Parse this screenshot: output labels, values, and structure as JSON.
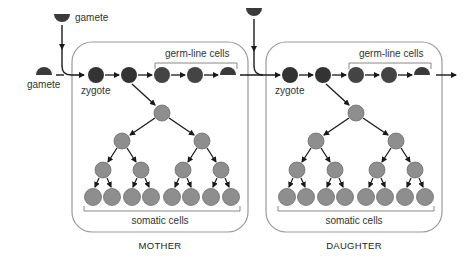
{
  "labels": {
    "gamete_top": "gamete",
    "gamete_left": "gamete",
    "mother": {
      "zygote": "zygote",
      "germ_line": "germ-line cells",
      "somatic": "somatic cells",
      "title": "MOTHER"
    },
    "daughter": {
      "zygote": "zygote",
      "germ_line": "germ-line cells",
      "somatic": "somatic cells",
      "title": "DAUGHTER"
    }
  },
  "colors": {
    "germ_cell": "#3a3a3a",
    "somatic_cell": "#8e8e8e",
    "box_stroke": "#9a9a9a",
    "arrow": "#1a1a1a",
    "bracket": "#888888"
  }
}
